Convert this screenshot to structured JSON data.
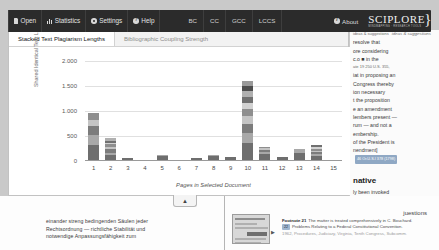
{
  "toolbar": {
    "items": [
      {
        "label": "Open",
        "icon": "file-icon"
      },
      {
        "label": "Statistics",
        "icon": "bars-icon"
      },
      {
        "label": "Settings",
        "icon": "gear-icon"
      },
      {
        "label": "Help",
        "icon": "help-icon"
      }
    ],
    "mini_items": [
      {
        "label": "BC"
      },
      {
        "label": "CC"
      },
      {
        "label": "GCC"
      },
      {
        "label": "LCCS"
      }
    ],
    "about_label": "About",
    "about_icon": "info-icon",
    "logo_main": "SCIPLORE",
    "logo_sub": "MINDMAPPING  ·  RESEARCH TOOLS",
    "logo_tagline": "ideas & suggestions"
  },
  "panel": {
    "tabs": [
      {
        "label": "Stacked Text Plagiarism Lengths",
        "active": true
      },
      {
        "label": "Bibliographic Coupling Strength",
        "active": false
      }
    ],
    "collapse_icon": "chevron-up-icon"
  },
  "chart_data": {
    "type": "bar",
    "stacked": true,
    "title": "Stacked Text Plagiarism Lengths",
    "xlabel": "Pages in Selected Document",
    "ylabel": "Shared Identical Text Lengths",
    "categories": [
      "1",
      "2",
      "3",
      "4",
      "5",
      "6",
      "7",
      "8",
      "9",
      "10",
      "11",
      "12",
      "13",
      "14",
      "15"
    ],
    "ytick_labels": [
      "2.000",
      "1.500",
      "1.000",
      "500",
      "0"
    ],
    "ytick_values": [
      2000,
      1500,
      1000,
      500,
      0
    ],
    "ylim": [
      0,
      2000
    ],
    "grid": true,
    "legend": "none",
    "series": [
      {
        "name": "segment-1",
        "color": "#6e6e6e",
        "values": [
          300,
          95,
          40,
          0,
          90,
          0,
          35,
          85,
          60,
          340,
          120,
          55,
          150,
          80,
          0
        ]
      },
      {
        "name": "segment-2",
        "color": "#a8a8a8",
        "values": [
          200,
          55,
          0,
          0,
          20,
          0,
          0,
          25,
          10,
          210,
          45,
          0,
          65,
          45,
          0
        ]
      },
      {
        "name": "segment-3",
        "color": "#7c7c7c",
        "values": [
          180,
          70,
          0,
          0,
          0,
          0,
          0,
          0,
          0,
          175,
          35,
          0,
          0,
          35,
          0
        ]
      },
      {
        "name": "segment-4",
        "color": "#c4c4c4",
        "values": [
          130,
          50,
          0,
          0,
          0,
          0,
          0,
          0,
          0,
          160,
          40,
          0,
          0,
          30,
          0
        ]
      },
      {
        "name": "segment-5",
        "color": "#8e8e8e",
        "values": [
          130,
          45,
          0,
          0,
          0,
          0,
          0,
          0,
          0,
          140,
          25,
          0,
          0,
          40,
          0
        ]
      },
      {
        "name": "segment-6",
        "color": "#d2d2d2",
        "values": [
          0,
          35,
          0,
          0,
          0,
          0,
          0,
          0,
          0,
          125,
          0,
          0,
          0,
          30,
          0
        ]
      },
      {
        "name": "segment-7",
        "color": "#707070",
        "values": [
          0,
          40,
          0,
          0,
          0,
          0,
          0,
          0,
          0,
          120,
          0,
          0,
          0,
          35,
          0
        ]
      },
      {
        "name": "segment-8",
        "color": "#b0b0b0",
        "values": [
          0,
          45,
          0,
          0,
          0,
          0,
          0,
          0,
          0,
          110,
          0,
          0,
          0,
          0,
          0
        ]
      },
      {
        "name": "segment-9",
        "color": "#4e4e4e",
        "values": [
          0,
          0,
          0,
          0,
          0,
          0,
          0,
          0,
          0,
          110,
          0,
          0,
          0,
          0,
          0
        ]
      },
      {
        "name": "segment-10",
        "color": "#9a9a9a",
        "values": [
          0,
          0,
          0,
          0,
          0,
          0,
          0,
          0,
          0,
          90,
          0,
          0,
          0,
          0,
          0
        ]
      }
    ],
    "totals": [
      940,
      435,
      40,
      0,
      110,
      0,
      35,
      110,
      70,
      1580,
      265,
      55,
      215,
      295,
      0
    ]
  },
  "reading_pane": {
    "lines": [
      {
        "text": "ideas & suggestions",
        "style": "tiny"
      },
      {
        "text": "resolve that"
      },
      {
        "text": "ore considering"
      },
      {
        "text": "c.o  ■  in the",
        "badge": true
      },
      {
        "text": "ate 19  250 U.S. 355,",
        "style": "tiny"
      },
      {
        "text": "iat in proposing an"
      },
      {
        "text": "Congress thereby"
      },
      {
        "text": "ion necessary"
      },
      {
        "text": "t the proposition"
      },
      {
        "text": "e an amendment"
      },
      {
        "text": "lembers present —"
      },
      {
        "text": "rum — and not a"
      },
      {
        "text": "embership."
      },
      {
        "text": "of the President is"
      },
      {
        "text": "nendment]"
      },
      {
        "text": "46 Or.U.S.I 378 (1798)",
        "style": "cite"
      }
    ],
    "heading": "native",
    "after_heading": [
      {
        "text": "ly been invoked"
      },
      {
        "text": "pment is"
      }
    ]
  },
  "bottom_document": {
    "german_lines": [
      "einander streng bedingenden Säulen jeder",
      "Rechtsordnung — richtliche Stabilität und",
      "notwendige Anpassungsfähigkeit zum"
    ],
    "right_word": "juestions",
    "footnotes": [
      {
        "lead": "Footnote 21",
        "text": "The matter is treated comprehensively in C. Bouchard."
      },
      {
        "badge": "22",
        "text": "Problems Relating to a Federal Constitutional Convention."
      },
      {
        "text": "1962, Procedures, Judiciary, Virginia, Tenth Congress, Subcomm.",
        "faint": true
      }
    ]
  }
}
